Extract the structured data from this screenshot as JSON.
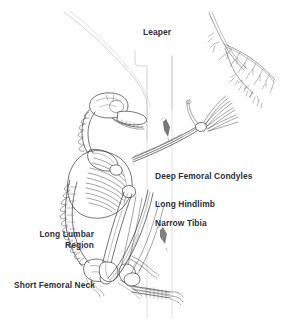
{
  "figure": {
    "type": "anatomical-line-drawing",
    "background_color": "#ffffff",
    "ink_color": "#3a3a3a",
    "label_color": "#2b2f3a",
    "faint_line_color": "#b9bcc4"
  },
  "labels": {
    "title": "Leaper",
    "deep_femoral_condyles": "Deep Femoral Condyles",
    "long_hindlimb": "Long Hindlimb",
    "narrow_tibia": "Narrow Tibia",
    "long_lumbar_region": "Long Lumbar\nRegion",
    "short_femoral_neck": "Short Femoral Neck"
  },
  "scene_elements": {
    "tree_trunk": "vertical tree trunk rendered as faint grey outlines",
    "tree_branch": "branching twig with fine leafy tips at upper right",
    "skeleton": "articulated primate skeleton clinging to trunk",
    "skull": "small primate skull with elongated snout facing right",
    "vertebral_column": "elongated cervical and lumbar vertebral column",
    "ribcage": "ribcage with fine parallel rib lines",
    "forelimb": "forelimb extended upward-right grasping a branch",
    "hindlimb": "long flexed hindlimb with femur and elongated narrow tibia",
    "foot": "elongated foot gripping the trunk at the base",
    "bark_marks": "two small dark bark markings on the trunk"
  }
}
